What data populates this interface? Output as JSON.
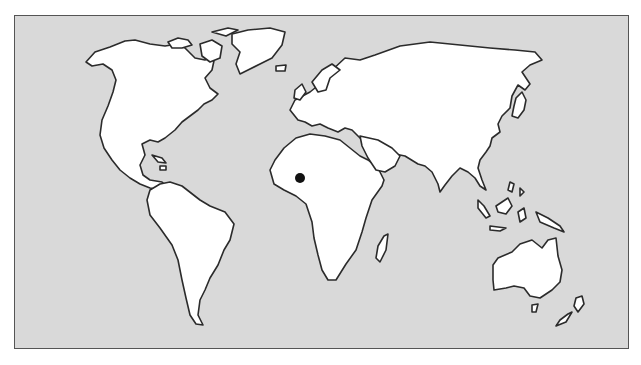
{
  "map": {
    "type": "world-outline",
    "colors": {
      "ocean": "#d9d9d9",
      "land": "#ffffff",
      "coast": "#2b2b2b",
      "marker": "#111111",
      "frame": "#555555"
    },
    "marker": {
      "x": 300,
      "y": 178,
      "r": 5,
      "region": "West Africa"
    }
  }
}
